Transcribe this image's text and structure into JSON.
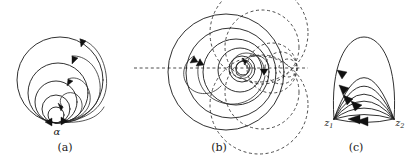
{
  "figure": {
    "background_color": "#ffffff",
    "stroke_color": "#1a1a1a",
    "dashed_color": "#3a3a3a",
    "width": 419,
    "height": 167
  },
  "panels": [
    {
      "id": "panel-a",
      "caption": "(a)",
      "caption_x": 65,
      "caption_y": 141,
      "description": "Nested circles mutually tangent at the point alpha with flow arrowheads",
      "labels": [
        {
          "name": "alpha",
          "text": "α",
          "x": 57,
          "y": 131
        }
      ],
      "tangent_point": {
        "x": 56,
        "y": 123
      },
      "circle_radii": [
        8,
        14,
        21,
        30,
        43
      ]
    },
    {
      "id": "panel-b",
      "caption": "(b)",
      "caption_x": 219,
      "caption_y": 141,
      "description": "Loxodromic spiral family about a fixed point with dashed orthogonal coaxial circles and dashed axis",
      "center": {
        "x": 247,
        "y": 68
      },
      "focus": {
        "x": 295,
        "y": 68
      },
      "axis": {
        "x1": 134,
        "x2": 308,
        "y": 68
      },
      "circle_radii": [
        12,
        22,
        32,
        42,
        52,
        64
      ],
      "dashed_circle_radii": [
        10,
        20,
        30,
        42
      ],
      "labels": []
    },
    {
      "id": "panel-c",
      "caption": "(c)",
      "caption_x": 356,
      "caption_y": 141,
      "description": "Family of circular arcs joining z1 and z2 with arrowheads directed toward z1",
      "point_left": {
        "x": 334,
        "y": 119
      },
      "point_right": {
        "x": 394,
        "y": 119
      },
      "labels": [
        {
          "name": "z1",
          "text": "z",
          "sub": "1",
          "x": 329,
          "y": 124
        },
        {
          "name": "z2",
          "text": "z",
          "sub": "2",
          "x": 400,
          "y": 124
        }
      ],
      "arc_bulges": [
        -2,
        6,
        14,
        22,
        30,
        40,
        50
      ]
    }
  ]
}
